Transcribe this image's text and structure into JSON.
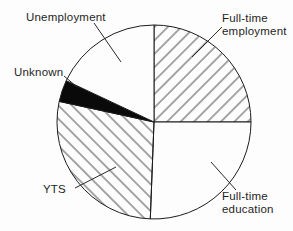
{
  "figure": {
    "background_color": "#fdfdfd"
  },
  "chart_data": {
    "type": "pie",
    "direction": "clockwise",
    "start_angle_deg": 0,
    "unit": "percent",
    "legend": "none",
    "labels_style": "external-with-leader-lines",
    "slices": [
      {
        "id": "full-time-employment",
        "label": "Full-time employment",
        "percent": 25.0,
        "fill": "hatch-forward"
      },
      {
        "id": "full-time-education",
        "label": "Full-time education",
        "percent": 25.6,
        "fill": "white"
      },
      {
        "id": "yts",
        "label": "YTS",
        "percent": 27.8,
        "fill": "hatch-back"
      },
      {
        "id": "unknown",
        "label": "Unknown",
        "percent": 3.6,
        "fill": "black"
      },
      {
        "id": "unemployment",
        "label": "Unemployment",
        "percent": 18.0,
        "fill": "white"
      }
    ],
    "colors": {
      "outline": "#1c1c1c",
      "hatch": "#3c3c3c",
      "black_fill": "#0a0a0a",
      "white_fill": "#fdfdfd",
      "leader_line": "#2a2a2a",
      "text": "#1f1f1f"
    }
  }
}
